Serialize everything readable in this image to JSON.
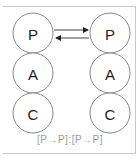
{
  "diagram": {
    "left_column": {
      "nodes": [
        {
          "label": "P"
        },
        {
          "label": "A"
        },
        {
          "label": "C"
        }
      ]
    },
    "right_column": {
      "nodes": [
        {
          "label": "P"
        },
        {
          "label": "A"
        },
        {
          "label": "C"
        }
      ]
    },
    "arrows": [
      {
        "from": "left.P",
        "to": "right.P",
        "direction": "right"
      },
      {
        "from": "right.P",
        "to": "left.P",
        "direction": "left"
      }
    ],
    "caption": "[P→P]:[P→P]",
    "colors": {
      "circle_stroke": "#8a8a8a",
      "label": "#222222",
      "caption": "#9a9a9a",
      "frame": "#c8c8c8"
    }
  }
}
